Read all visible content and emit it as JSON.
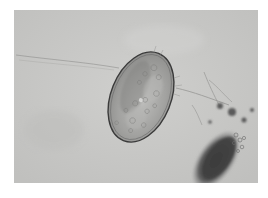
{
  "figure": {
    "background_color": "#c8c8c6",
    "egg_shell_color": "#3a3a3a",
    "debris_color": "#555555",
    "caption": ""
  }
}
